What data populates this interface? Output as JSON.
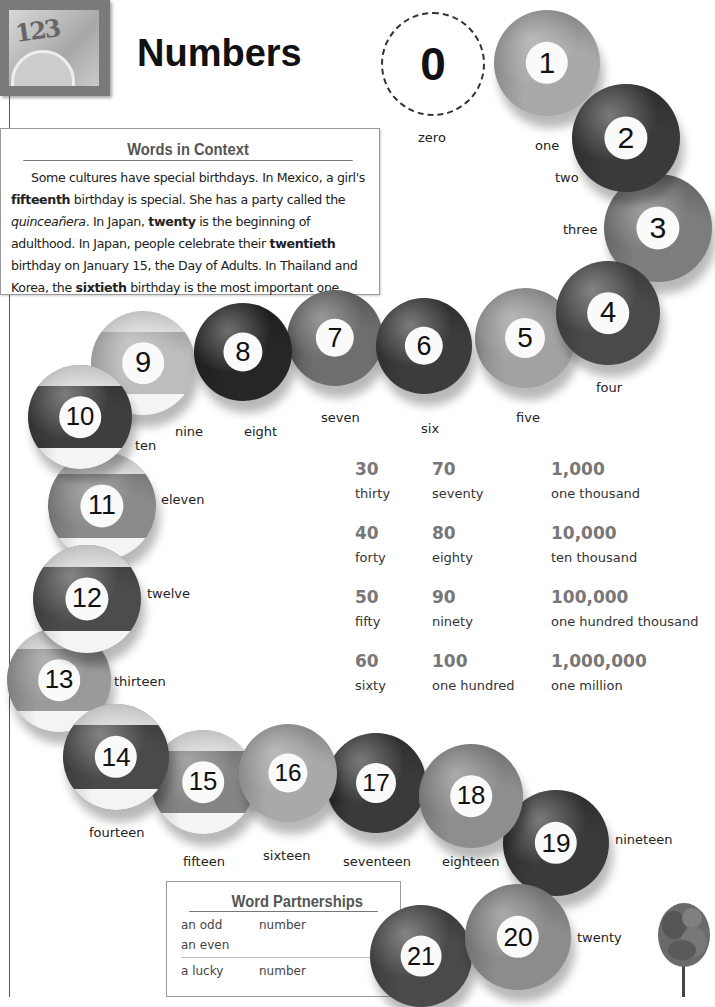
{
  "header": {
    "title": "Numbers",
    "thumbnail_icon": "numbers-clock-photo",
    "thumbnail_digits": "123"
  },
  "zero": {
    "numeral": "0",
    "word": "zero"
  },
  "words_in_context": {
    "title": "Words in Context",
    "segments": [
      {
        "text": "Some cultures have special birthdays. In Mexico, a girl's ",
        "style": "normal"
      },
      {
        "text": "fifteenth",
        "style": "bold"
      },
      {
        "text": " birthday is special. She has a party called the ",
        "style": "normal"
      },
      {
        "text": "quinceañera",
        "style": "italic"
      },
      {
        "text": ". In Japan, ",
        "style": "normal"
      },
      {
        "text": "twenty",
        "style": "bold"
      },
      {
        "text": " is the beginning of adulthood. In Japan, people celebrate their ",
        "style": "normal"
      },
      {
        "text": "twentieth",
        "style": "bold"
      },
      {
        "text": " birthday on January 15, the Day of Adults. In Thailand and Korea, the ",
        "style": "normal"
      },
      {
        "text": "sixtieth",
        "style": "bold"
      },
      {
        "text": " birthday is the most important one.",
        "style": "normal"
      }
    ]
  },
  "balls": [
    {
      "n": "1",
      "word": "one",
      "x": 494,
      "y": 10,
      "d": 106,
      "color": "#a9a9a9",
      "stripe": false,
      "lx": 535,
      "ly": 138
    },
    {
      "n": "2",
      "word": "two",
      "x": 572,
      "y": 84,
      "d": 108,
      "color": "#3a3a3a",
      "stripe": false,
      "lx": 555,
      "ly": 170
    },
    {
      "n": "3",
      "word": "three",
      "x": 604,
      "y": 174,
      "d": 108,
      "color": "#7d7d7d",
      "stripe": false,
      "lx": 563,
      "ly": 222
    },
    {
      "n": "4",
      "word": "four",
      "x": 556,
      "y": 261,
      "d": 104,
      "color": "#4a4a4a",
      "stripe": false,
      "lx": 596,
      "ly": 380
    },
    {
      "n": "5",
      "word": "five",
      "x": 475,
      "y": 288,
      "d": 100,
      "color": "#a2a2a2",
      "stripe": false,
      "lx": 516,
      "ly": 410
    },
    {
      "n": "6",
      "word": "six",
      "x": 376,
      "y": 298,
      "d": 96,
      "color": "#3c3c3c",
      "stripe": false,
      "lx": 421,
      "ly": 421
    },
    {
      "n": "7",
      "word": "seven",
      "x": 287,
      "y": 290,
      "d": 96,
      "color": "#6e6e6e",
      "stripe": false,
      "lx": 321,
      "ly": 410
    },
    {
      "n": "8",
      "word": "eight",
      "x": 194,
      "y": 303,
      "d": 98,
      "color": "#262626",
      "stripe": false,
      "lx": 244,
      "ly": 424
    },
    {
      "n": "9",
      "word": "nine",
      "x": 91,
      "y": 311,
      "d": 104,
      "color": "#bdbdbd",
      "stripe": true,
      "lx": 175,
      "ly": 424
    },
    {
      "n": "10",
      "word": "ten",
      "x": 28,
      "y": 365,
      "d": 104,
      "color": "#3e3e3e",
      "stripe": true,
      "lx": 135,
      "ly": 438
    },
    {
      "n": "11",
      "word": "eleven",
      "x": 48,
      "y": 452,
      "d": 108,
      "color": "#8a8a8a",
      "stripe": true,
      "lx": 161,
      "ly": 492
    },
    {
      "n": "12",
      "word": "twelve",
      "x": 33,
      "y": 545,
      "d": 108,
      "color": "#4c4c4c",
      "stripe": true,
      "lx": 147,
      "ly": 586
    },
    {
      "n": "13",
      "word": "thirteen",
      "x": 7,
      "y": 628,
      "d": 104,
      "color": "#9a9a9a",
      "stripe": true,
      "lx": 114,
      "ly": 674
    },
    {
      "n": "14",
      "word": "fourteen",
      "x": 63,
      "y": 704,
      "d": 106,
      "color": "#4a4a4a",
      "stripe": true,
      "lx": 89,
      "ly": 825
    },
    {
      "n": "15",
      "word": "fifteen",
      "x": 151,
      "y": 730,
      "d": 104,
      "color": "#858585",
      "stripe": true,
      "lx": 183,
      "ly": 854
    },
    {
      "n": "16",
      "word": "sixteen",
      "x": 239,
      "y": 724,
      "d": 98,
      "color": "#a9a9a9",
      "stripe": false,
      "lx": 263,
      "ly": 848
    },
    {
      "n": "17",
      "word": "seventeen",
      "x": 326,
      "y": 733,
      "d": 100,
      "color": "#3a3a3a",
      "stripe": false,
      "lx": 343,
      "ly": 854
    },
    {
      "n": "18",
      "word": "eighteen",
      "x": 419,
      "y": 744,
      "d": 104,
      "color": "#8e8e8e",
      "stripe": false,
      "lx": 442,
      "ly": 854
    },
    {
      "n": "19",
      "word": "nineteen",
      "x": 503,
      "y": 790,
      "d": 106,
      "color": "#3a3a3a",
      "stripe": false,
      "lx": 615,
      "ly": 832
    },
    {
      "n": "20",
      "word": "twenty",
      "x": 465,
      "y": 884,
      "d": 106,
      "color": "#8c8c8c",
      "stripe": false,
      "lx": 577,
      "ly": 930
    },
    {
      "n": "21",
      "word": "",
      "x": 370,
      "y": 905,
      "d": 102,
      "color": "#4a4a4a",
      "stripe": false,
      "lx": 0,
      "ly": 0
    }
  ],
  "number_table": {
    "columns": [
      {
        "x": 355,
        "rows": [
          {
            "num": "30",
            "word": "thirty"
          },
          {
            "num": "40",
            "word": "forty"
          },
          {
            "num": "50",
            "word": "fifty"
          },
          {
            "num": "60",
            "word": "sixty"
          }
        ]
      },
      {
        "x": 432,
        "rows": [
          {
            "num": "70",
            "word": "seventy"
          },
          {
            "num": "80",
            "word": "eighty"
          },
          {
            "num": "90",
            "word": "ninety"
          },
          {
            "num": "100",
            "word": "one hundred"
          }
        ]
      },
      {
        "x": 551,
        "rows": [
          {
            "num": "1,000",
            "word": "one thousand"
          },
          {
            "num": "10,000",
            "word": "ten thousand"
          },
          {
            "num": "100,000",
            "word": "one hundred thousand"
          },
          {
            "num": "1,000,000",
            "word": "one million"
          }
        ]
      }
    ]
  },
  "word_partnerships": {
    "title": "Word Partnerships",
    "groups": [
      {
        "left": [
          "an odd",
          "an even"
        ],
        "right": "number"
      },
      {
        "left": [
          "a lucky"
        ],
        "right": "number"
      }
    ]
  },
  "decorations": {
    "tree_icon": "tree-icon"
  }
}
